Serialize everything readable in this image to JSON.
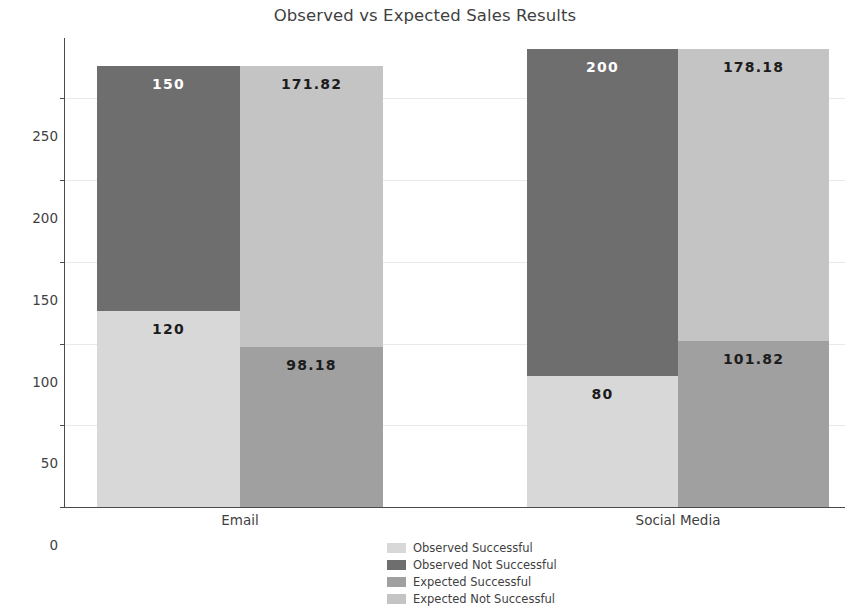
{
  "chart_data": {
    "type": "bar",
    "subtype": "stacked-grouped-bar",
    "title": "Observed vs Expected Sales Results",
    "xlabel": "",
    "ylabel": "Counts",
    "categories": [
      "Email",
      "Social Media"
    ],
    "groups": [
      {
        "category": "Email",
        "bars": [
          {
            "name": "Observed",
            "segments": [
              {
                "series": "Observed Successful",
                "value": 120,
                "label": "120",
                "color": "#d8d8d8",
                "label_color": "#1c1c1c"
              },
              {
                "series": "Observed Not Successful",
                "value": 150,
                "label": "150",
                "color": "#6e6e6e",
                "label_color": "#ffffff"
              }
            ],
            "total": 270
          },
          {
            "name": "Expected",
            "segments": [
              {
                "series": "Expected Successful",
                "value": 98.18,
                "label": "98.18",
                "color": "#a0a0a0",
                "label_color": "#1c1c1c"
              },
              {
                "series": "Expected Not Successful",
                "value": 171.82,
                "label": "171.82",
                "color": "#c4c4c4",
                "label_color": "#1c1c1c"
              }
            ],
            "total": 270
          }
        ]
      },
      {
        "category": "Social Media",
        "bars": [
          {
            "name": "Observed",
            "segments": [
              {
                "series": "Observed Successful",
                "value": 80,
                "label": "80",
                "color": "#d8d8d8",
                "label_color": "#1c1c1c"
              },
              {
                "series": "Observed Not Successful",
                "value": 200,
                "label": "200",
                "color": "#6e6e6e",
                "label_color": "#ffffff"
              }
            ],
            "total": 280
          },
          {
            "name": "Expected",
            "segments": [
              {
                "series": "Expected Successful",
                "value": 101.82,
                "label": "101.82",
                "color": "#a0a0a0",
                "label_color": "#1c1c1c"
              },
              {
                "series": "Expected Not Successful",
                "value": 178.18,
                "label": "178.18",
                "color": "#c4c4c4",
                "label_color": "#1c1c1c"
              }
            ],
            "total": 280
          }
        ]
      }
    ],
    "series": [
      {
        "name": "Observed Successful",
        "color": "#d8d8d8",
        "values": [
          120,
          80
        ]
      },
      {
        "name": "Observed Not Successful",
        "color": "#6e6e6e",
        "values": [
          150,
          200
        ]
      },
      {
        "name": "Expected Successful",
        "color": "#a0a0a0",
        "values": [
          98.18,
          101.82
        ]
      },
      {
        "name": "Expected Not Successful",
        "color": "#c4c4c4",
        "values": [
          171.82,
          178.18
        ]
      }
    ],
    "yticks": [
      0,
      50,
      100,
      150,
      200,
      250
    ],
    "ytick_labels": [
      "0",
      "50",
      "100",
      "150",
      "200",
      "250"
    ],
    "ylim": [
      0,
      287
    ],
    "grid": true,
    "grid_color": "#e9e9e9",
    "legend": {
      "position": "bottom-center",
      "entries": [
        {
          "label": "Observed Successful",
          "color": "#d8d8d8"
        },
        {
          "label": "Observed Not Successful",
          "color": "#6e6e6e"
        },
        {
          "label": "Expected Successful",
          "color": "#a0a0a0"
        },
        {
          "label": "Expected Not Successful",
          "color": "#c4c4c4"
        }
      ]
    }
  }
}
